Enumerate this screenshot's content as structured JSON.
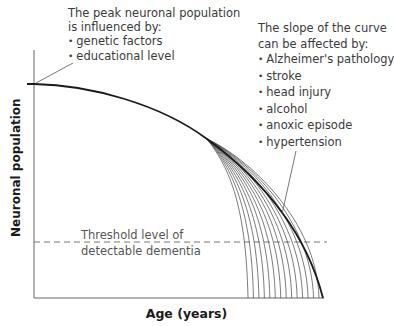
{
  "diagram": {
    "type": "neuronal-population-curve",
    "axes": {
      "x_label": "Age (years)",
      "y_label": "Neuronal population"
    },
    "peak_annotation": {
      "heading_line1": "The peak neuronal population",
      "heading_line2": "is influenced by:",
      "items": [
        "genetic factors",
        "educational level"
      ]
    },
    "slope_annotation": {
      "heading_line1": "The slope of the curve",
      "heading_line2": "can be affected by:",
      "items": [
        "Alzheimer's pathology",
        "stroke",
        "head injury",
        "alcohol",
        "anoxic episode",
        "hypertension"
      ]
    },
    "threshold": {
      "line1": "Threshold level of",
      "line2": "detectable dementia"
    },
    "colors": {
      "curve": "#1a1a1a",
      "branch_curves": "#555555",
      "axes": "#666666",
      "threshold_line": "#777777",
      "text": "#3a3a3a"
    },
    "branch_curve_count": 14
  }
}
